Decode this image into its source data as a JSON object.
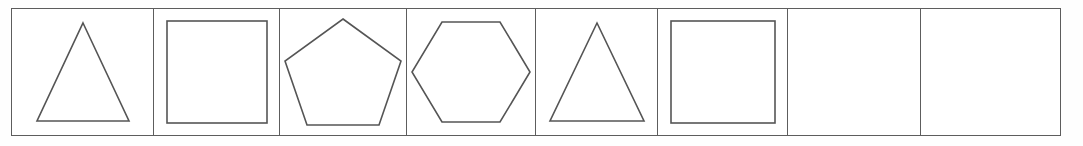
{
  "worksheet": {
    "type": "shape-pattern-strip",
    "description": "Single row of eight boxes; first six contain outlined geometric shapes forming a repeating pattern, last two are blank for the learner to complete.",
    "row_count": 1,
    "cell_count": 8,
    "filled_cell_count": 6,
    "blank_cell_count": 2,
    "pattern_sequence": [
      "triangle",
      "square",
      "pentagon",
      "hexagon",
      "triangle",
      "square",
      "",
      ""
    ],
    "colors": {
      "page_background": "#fefefe",
      "cell_background": "#ffffff",
      "grid_line": "#5d5d5d",
      "shape_stroke": "#555555"
    },
    "frame": {
      "left": 11,
      "top": 8,
      "width": 1050,
      "height": 128,
      "border_width": 1.5
    },
    "cells": [
      {
        "index": 1,
        "name": "triangle",
        "label": "",
        "sides": 3,
        "width": 142,
        "shape": "triangle",
        "shape_width": 98,
        "shape_height": 104,
        "filled": true
      },
      {
        "index": 2,
        "name": "square",
        "label": "",
        "sides": 4,
        "width": 126,
        "shape": "square",
        "shape_width": 104,
        "shape_height": 106,
        "filled": true
      },
      {
        "index": 3,
        "name": "pentagon",
        "label": "",
        "sides": 5,
        "width": 127,
        "shape": "pentagon",
        "shape_width": 122,
        "shape_height": 112,
        "filled": true
      },
      {
        "index": 4,
        "name": "hexagon",
        "label": "",
        "sides": 6,
        "width": 129,
        "shape": "hexagon",
        "shape_width": 124,
        "shape_height": 106,
        "filled": true
      },
      {
        "index": 5,
        "name": "triangle",
        "label": "",
        "sides": 3,
        "width": 122,
        "shape": "triangle",
        "shape_width": 100,
        "shape_height": 104,
        "filled": true
      },
      {
        "index": 6,
        "name": "square",
        "label": "",
        "sides": 4,
        "width": 130,
        "shape": "square",
        "shape_width": 108,
        "shape_height": 106,
        "filled": true
      },
      {
        "index": 7,
        "name": "blank",
        "label": "",
        "sides": 0,
        "width": 133,
        "shape": "none",
        "shape_width": 0,
        "shape_height": 0,
        "filled": false
      },
      {
        "index": 8,
        "name": "blank",
        "label": "",
        "sides": 0,
        "width": 137,
        "shape": "none",
        "shape_width": 0,
        "shape_height": 0,
        "filled": false
      }
    ]
  }
}
